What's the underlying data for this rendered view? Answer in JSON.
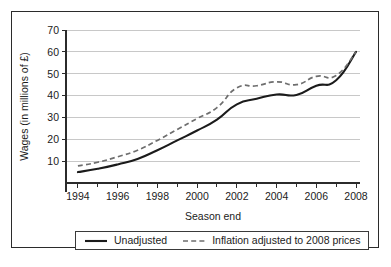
{
  "chart_data": {
    "type": "line",
    "title": "",
    "xlabel": "Season end",
    "ylabel": "Wages (in millions of £)",
    "xlim": [
      1993.4,
      2008.2
    ],
    "ylim": [
      0,
      70
    ],
    "xticks": [
      1994,
      1996,
      1998,
      2000,
      2002,
      2004,
      2006,
      2008
    ],
    "xtick_labels": [
      "1994",
      "1996",
      "1998",
      "2000",
      "2002",
      "2004",
      "2006",
      "2008"
    ],
    "minor_xticks": [
      1995,
      1997,
      1999,
      2001,
      2003,
      2005,
      2007
    ],
    "yticks": [
      10,
      20,
      30,
      40,
      50,
      60,
      70
    ],
    "ytick_labels": [
      "10",
      "20",
      "30",
      "40",
      "50",
      "60",
      "70"
    ],
    "grid": "horizontal",
    "legend_position": "below-axes",
    "x": [
      1994,
      1995,
      1996,
      1997,
      1998,
      1999,
      2000,
      2001,
      2002,
      2003,
      2004,
      2005,
      2006,
      2007,
      2008
    ],
    "series": [
      {
        "name": "Unadjusted",
        "style": "solid",
        "color": "#1b1b1b",
        "values": [
          5,
          6.5,
          8.5,
          11,
          15,
          19.5,
          24,
          29,
          36,
          38.5,
          40.5,
          40.3,
          44.5,
          47,
          60
        ]
      },
      {
        "name": "Inflation adjusted to 2008 prices",
        "style": "dashed",
        "color": "#6e6e6e",
        "values": [
          7.8,
          9.5,
          12,
          15,
          19.5,
          24.5,
          29.5,
          34.5,
          43.5,
          44.5,
          46.3,
          45,
          48.8,
          49.2,
          60
        ]
      }
    ]
  },
  "legend": {
    "entries": [
      {
        "label": "Unadjusted",
        "style": "solid"
      },
      {
        "label": "Inflation adjusted to 2008 prices",
        "style": "dashed"
      }
    ]
  }
}
